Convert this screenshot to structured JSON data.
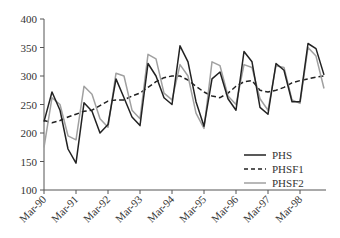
{
  "chart_data": {
    "type": "line",
    "title": "",
    "xlabel": "",
    "ylabel": "",
    "ylim": [
      100,
      400
    ],
    "yticks": [
      100,
      150,
      200,
      250,
      300,
      350,
      400
    ],
    "xtick_labels": [
      "Mar-90",
      "Mar-91",
      "Mar-92",
      "Mar-93",
      "Mar-94",
      "Mar-95",
      "Mar-96",
      "Mar-97",
      "Mar-98"
    ],
    "x": [
      "Mar-90",
      "Jun-90",
      "Sep-90",
      "Dec-90",
      "Mar-91",
      "Jun-91",
      "Sep-91",
      "Dec-91",
      "Mar-92",
      "Jun-92",
      "Sep-92",
      "Dec-92",
      "Mar-93",
      "Jun-93",
      "Sep-93",
      "Dec-93",
      "Mar-94",
      "Jun-94",
      "Sep-94",
      "Dec-94",
      "Mar-95",
      "Jun-95",
      "Sep-95",
      "Dec-95",
      "Mar-96",
      "Jun-96",
      "Sep-96",
      "Dec-96",
      "Mar-97",
      "Jun-97",
      "Sep-97",
      "Dec-97",
      "Mar-98",
      "Jun-98",
      "Sep-98",
      "Dec-98"
    ],
    "grid": false,
    "legend_position": "lower right",
    "series": [
      {
        "name": "PHS",
        "style": "solid",
        "color": "#222222",
        "values": [
          220,
          272,
          240,
          172,
          147,
          253,
          238,
          200,
          215,
          295,
          262,
          228,
          213,
          322,
          300,
          262,
          250,
          353,
          325,
          255,
          212,
          295,
          307,
          260,
          240,
          343,
          325,
          245,
          233,
          322,
          310,
          255,
          255,
          357,
          348,
          302
        ]
      },
      {
        "name": "PHSF1",
        "style": "dashed",
        "color": "#222222",
        "values": [
          222,
          218,
          222,
          228,
          233,
          238,
          240,
          248,
          256,
          258,
          258,
          265,
          270,
          280,
          290,
          297,
          300,
          300,
          293,
          282,
          272,
          265,
          262,
          270,
          282,
          290,
          292,
          275,
          272,
          275,
          280,
          288,
          292,
          295,
          298,
          300
        ]
      },
      {
        "name": "PHSF2",
        "style": "solid",
        "color": "#a0a0a0",
        "values": [
          175,
          262,
          250,
          195,
          188,
          282,
          268,
          225,
          210,
          305,
          300,
          240,
          225,
          338,
          330,
          270,
          258,
          320,
          300,
          235,
          208,
          325,
          318,
          265,
          250,
          320,
          315,
          260,
          240,
          318,
          315,
          258,
          252,
          350,
          335,
          278
        ]
      }
    ]
  },
  "legend": {
    "items": [
      {
        "label": "PHS"
      },
      {
        "label": "PHSF1"
      },
      {
        "label": "PHSF2"
      }
    ]
  }
}
